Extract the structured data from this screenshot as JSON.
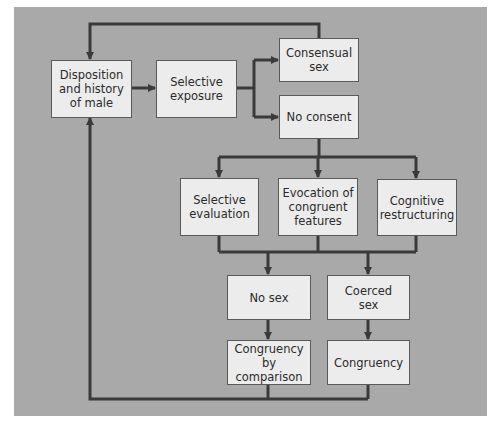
{
  "diagram": {
    "type": "flowchart",
    "colors": {
      "panel": "#a9a9a9",
      "box_fill": "#ececec",
      "box_border": "#5a5a5a",
      "line": "#3a3a3a"
    },
    "nodes": {
      "disposition": "Disposition\nand history\nof male",
      "selective_exposure": "Selective\nexposure",
      "consensual_sex": "Consensual\nsex",
      "no_consent": "No consent",
      "selective_evaluation": "Selective\nevaluation",
      "evocation": "Evocation of\ncongruent\nfeatures",
      "cognitive_restructuring": "Cognitive\nrestructuring",
      "no_sex": "No sex",
      "coerced_sex": "Coerced\nsex",
      "congruency_by_comparison": "Congruency\nby comparison",
      "congruency": "Congruency"
    },
    "edges": [
      [
        "disposition",
        "selective_exposure"
      ],
      [
        "selective_exposure",
        "consensual_sex"
      ],
      [
        "selective_exposure",
        "no_consent"
      ],
      [
        "consensual_sex",
        "disposition"
      ],
      [
        "no_consent",
        "selective_evaluation"
      ],
      [
        "no_consent",
        "evocation"
      ],
      [
        "no_consent",
        "cognitive_restructuring"
      ],
      [
        "selective_evaluation",
        "no_sex"
      ],
      [
        "evocation",
        "no_sex"
      ],
      [
        "cognitive_restructuring",
        "coerced_sex"
      ],
      [
        "no_sex",
        "congruency_by_comparison"
      ],
      [
        "coerced_sex",
        "congruency"
      ],
      [
        "congruency_by_comparison",
        "disposition"
      ],
      [
        "congruency",
        "disposition"
      ]
    ]
  }
}
